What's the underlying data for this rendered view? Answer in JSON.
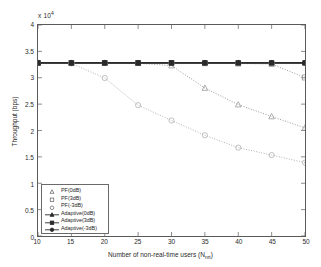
{
  "chart_data": {
    "type": "line",
    "title": "",
    "xlabel": "Number of non-real-time users (N",
    "xlabel_sub": "nrt",
    "xlabel_suffix": ")",
    "ylabel": "Throughput (bps)",
    "exponent_label": "x 10",
    "exponent_power": "4",
    "xlim": [
      10,
      50
    ],
    "ylim": [
      0,
      40000
    ],
    "xticks": [
      10,
      15,
      20,
      25,
      30,
      35,
      40,
      45,
      50
    ],
    "yticks": [
      0,
      5000,
      10000,
      15000,
      20000,
      25000,
      30000,
      35000,
      40000
    ],
    "ytick_labels": [
      "0",
      "0.5",
      "1",
      "1.5",
      "2",
      "2.5",
      "3",
      "3.5",
      "4"
    ],
    "xtick_labels": [
      "10",
      "15",
      "20",
      "25",
      "30",
      "35",
      "40",
      "45",
      "50"
    ],
    "grid": false,
    "legend_position": "lower left",
    "x": [
      10,
      15,
      20,
      25,
      30,
      35,
      40,
      45,
      50
    ],
    "series": [
      {
        "name": "PF(0dB)",
        "marker": "triangle",
        "line": "dotted",
        "color": "#9a9a9a",
        "values": [
          32800,
          32800,
          32800,
          32750,
          32300,
          28050,
          24900,
          22650,
          20500
        ]
      },
      {
        "name": "PF(3dB)",
        "marker": "square",
        "line": "dotted",
        "color": "#9a9a9a",
        "values": [
          32800,
          32800,
          32800,
          32800,
          32800,
          32750,
          32700,
          32600,
          30050
        ]
      },
      {
        "name": "PF(-3dB)",
        "marker": "circle",
        "line": "dotted",
        "color": "#b0b0b0",
        "values": [
          32800,
          32700,
          29950,
          24800,
          21900,
          19100,
          16750,
          15350,
          13900
        ]
      },
      {
        "name": "Adaptive(0dB)",
        "marker": "triangle",
        "line": "solid",
        "color": "#2a2a2a",
        "values": [
          32800,
          32800,
          32800,
          32800,
          32800,
          32800,
          32800,
          32800,
          32800
        ]
      },
      {
        "name": "Adaptive(3dB)",
        "marker": "square",
        "line": "solid",
        "color": "#2a2a2a",
        "values": [
          32820,
          32820,
          32820,
          32820,
          32820,
          32820,
          32820,
          32820,
          32820
        ]
      },
      {
        "name": "Adaptive(-3dB)",
        "marker": "circle",
        "line": "solid",
        "color": "#2a2a2a",
        "values": [
          32840,
          32840,
          32840,
          32840,
          32840,
          32840,
          32840,
          32840,
          32840
        ]
      }
    ],
    "legend": [
      {
        "label": "PF(0dB)",
        "marker": "triangle",
        "line": false
      },
      {
        "label": "PF(3dB)",
        "marker": "square",
        "line": false
      },
      {
        "label": "PF(-3dB)",
        "marker": "circle",
        "line": false
      },
      {
        "label": "Adaptive(0dB)",
        "marker": "triangle",
        "line": true
      },
      {
        "label": "Adaptive(3dB)",
        "marker": "square",
        "line": true
      },
      {
        "label": "Adaptive(-3dB)",
        "marker": "circle",
        "line": true
      }
    ]
  }
}
